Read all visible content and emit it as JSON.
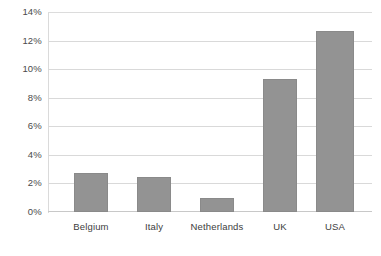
{
  "chart_data": {
    "type": "bar",
    "title": "",
    "subtitle": "",
    "xlabel": "",
    "ylabel": "",
    "categories": [
      "Belgium",
      "Italy",
      "Netherlands",
      "UK",
      "USA"
    ],
    "values": [
      2.7,
      2.45,
      1.0,
      9.3,
      12.7
    ],
    "value_labels": [
      "2.7%",
      "2.45%",
      "1.0%",
      "9.3%",
      "12.7%"
    ],
    "ylim": [
      0,
      14
    ],
    "ytick_values": [
      0,
      2,
      4,
      6,
      8,
      10,
      12,
      14
    ],
    "ytick_labels": [
      "0%",
      "2%",
      "4%",
      "6%",
      "8%",
      "10%",
      "12%",
      "14%"
    ],
    "grid": true,
    "grid_axis": "y",
    "legend": false,
    "legend_position": "none",
    "bar_color": "#939393",
    "bar_edge_color": "#8a8a8a",
    "gridline_color": "#d9d9d9",
    "axis_color": "#c8c8c8",
    "text_color": "#3d3d3d",
    "background_color": "#ffffff"
  }
}
